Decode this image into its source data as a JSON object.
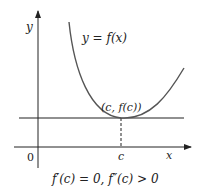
{
  "diagram": {
    "axis_x_label": "x",
    "axis_y_label": "y",
    "origin_label": "0",
    "curve_label": "y = f(x)",
    "point_label": "(c, f(c))",
    "tick_label_c": "c",
    "caption": "f′(c) = 0, f″(c) > 0",
    "colors": {
      "stroke": "#222222",
      "curve": "#444444"
    }
  }
}
